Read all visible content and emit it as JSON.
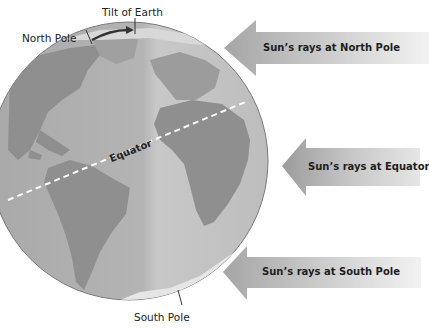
{
  "diagram": {
    "labels": {
      "tilt": "Tilt of Earth",
      "north_pole": "North Pole",
      "south_pole": "South Pole",
      "equator": "Equator"
    },
    "rays": [
      {
        "id": "north",
        "label": "Sun’s rays at North Pole"
      },
      {
        "id": "equator",
        "label": "Sun’s rays at Equator"
      },
      {
        "id": "south",
        "label": "Sun’s rays at South Pole"
      }
    ],
    "colors": {
      "ocean": "#b8b8b8",
      "land": "#8e8e8e",
      "arrow_dark": "#9a9a9a",
      "arrow_light": "#eeeeee",
      "tilt_arrow": "#333333"
    }
  }
}
